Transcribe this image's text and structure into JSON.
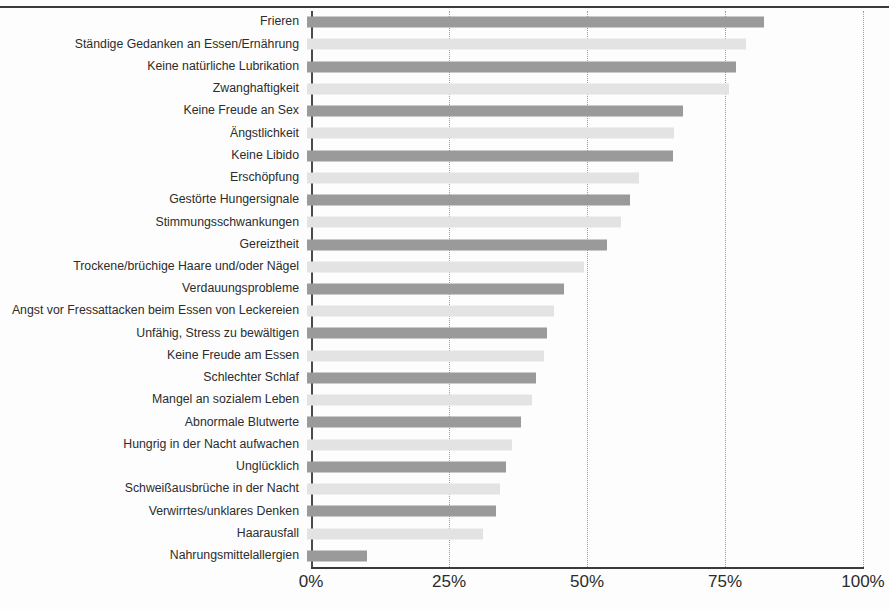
{
  "chart_data": {
    "type": "bar",
    "orientation": "horizontal",
    "title": "",
    "subtitle": "",
    "xlabel": "",
    "ylabel": "",
    "xlim": [
      0,
      100
    ],
    "xticks": [
      "0%",
      "25%",
      "50%",
      "75%",
      "100%"
    ],
    "xtick_values": [
      0,
      25,
      50,
      75,
      100
    ],
    "grid": "vertical dotted gridlines at 25%, 50%, 75%, 100%",
    "legend": "none",
    "colors": {
      "bar_dark": "#9a9a9a",
      "bar_light": "#e3e3e3",
      "axis": "#3a3a3a",
      "gridline": "#9b9b9b",
      "text": "#2c2c2c",
      "background": "#fdfdfd"
    },
    "categories": [
      "Frieren",
      "Ständige Gedanken an Essen/Ernährung",
      "Keine natürliche Lubrikation",
      "Zwanghaftigkeit",
      "Keine Freude an Sex",
      "Ängstlichkeit",
      "Keine Libido",
      "Erschöpfung",
      "Gestörte Hungersignale",
      "Stimmungsschwankungen",
      "Gereiztheit",
      "Trockene/brüchige Haare und/oder Nägel",
      "Verdauungsprobleme",
      "Angst vor Fressattacken beim Essen von Leckereien",
      "Unfähig, Stress zu bewältigen",
      "Keine Freude am Essen",
      "Schlechter Schlaf",
      "Mangel an sozialem Leben",
      "Abnormale Blutwerte",
      "Hungrig in der Nacht aufwachen",
      "Unglücklich",
      "Schweißausbrüche in der Nacht",
      "Verwirrtes/unklares Denken",
      "Haarausfall",
      "Nahrungsmittelallergien"
    ],
    "values": [
      82.8,
      79.5,
      77.7,
      76.4,
      68.1,
      66.5,
      66.3,
      60.1,
      58.6,
      56.8,
      54.4,
      50.1,
      46.5,
      44.7,
      43.5,
      43.0,
      41.4,
      40.8,
      38.8,
      37.2,
      36.0,
      34.9,
      34.2,
      31.8,
      10.9
    ],
    "bar_shades": [
      "dark",
      "light",
      "dark",
      "light",
      "dark",
      "light",
      "dark",
      "light",
      "dark",
      "light",
      "dark",
      "light",
      "dark",
      "light",
      "dark",
      "light",
      "dark",
      "light",
      "dark",
      "light",
      "dark",
      "light",
      "dark",
      "light",
      "dark"
    ]
  }
}
